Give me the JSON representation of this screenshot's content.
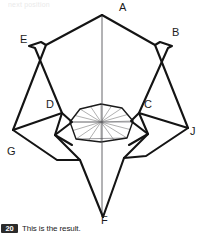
{
  "page": {
    "background_color": "#ffffff",
    "faded_header_text": "next position",
    "ink_color": "#1a1a1a",
    "crease_color": "#6d6d6d"
  },
  "caption": {
    "step_number": "20",
    "text": "This is the result."
  },
  "figure": {
    "name": "origami-folded-model",
    "vertex_labels": [
      {
        "id": "A",
        "label": "A",
        "x": 119,
        "y": 11
      },
      {
        "id": "B",
        "label": "B",
        "x": 172,
        "y": 36
      },
      {
        "id": "C",
        "label": "C",
        "x": 144,
        "y": 108
      },
      {
        "id": "D",
        "label": "D",
        "x": 46,
        "y": 108
      },
      {
        "id": "E",
        "label": "E",
        "x": 20,
        "y": 43
      },
      {
        "id": "F",
        "label": "F",
        "x": 101,
        "y": 224
      },
      {
        "id": "G",
        "label": "G",
        "x": 7,
        "y": 155
      },
      {
        "id": "J",
        "label": "J",
        "x": 190,
        "y": 135
      }
    ],
    "outline_points": [
      [
        102,
        15
      ],
      [
        168,
        48
      ],
      [
        172,
        46
      ],
      [
        160,
        42
      ],
      [
        155,
        45
      ],
      [
        188,
        128
      ],
      [
        170,
        122
      ],
      [
        139,
        113
      ],
      [
        131,
        121
      ],
      [
        148,
        134
      ],
      [
        124,
        158
      ],
      [
        103,
        217
      ],
      [
        80,
        160
      ],
      [
        55,
        135
      ],
      [
        72,
        122
      ],
      [
        62,
        113
      ],
      [
        31,
        122
      ],
      [
        13,
        130
      ],
      [
        46,
        45
      ],
      [
        41,
        42
      ],
      [
        29,
        46
      ],
      [
        35,
        48
      ]
    ],
    "main_strokes": [
      {
        "name": "apex-left-edge",
        "points": [
          [
            102,
            15
          ],
          [
            46,
            45
          ],
          [
            13,
            130
          ]
        ]
      },
      {
        "name": "apex-right-edge",
        "points": [
          [
            102,
            15
          ],
          [
            155,
            45
          ],
          [
            188,
            128
          ]
        ]
      },
      {
        "name": "left-peak",
        "points": [
          [
            46,
            45
          ],
          [
            41,
            42
          ],
          [
            29,
            46
          ],
          [
            35,
            48
          ],
          [
            62,
            113
          ]
        ]
      },
      {
        "name": "right-peak",
        "points": [
          [
            155,
            45
          ],
          [
            160,
            42
          ],
          [
            172,
            46
          ],
          [
            168,
            48
          ],
          [
            139,
            113
          ]
        ]
      },
      {
        "name": "left-lower-flap",
        "points": [
          [
            13,
            130
          ],
          [
            62,
            113
          ],
          [
            72,
            122
          ],
          [
            55,
            135
          ],
          [
            80,
            160
          ],
          [
            103,
            217
          ]
        ]
      },
      {
        "name": "right-lower-flap",
        "points": [
          [
            188,
            128
          ],
          [
            139,
            113
          ],
          [
            131,
            121
          ],
          [
            148,
            134
          ],
          [
            124,
            158
          ],
          [
            103,
            217
          ]
        ]
      },
      {
        "name": "left-flap-fold",
        "points": [
          [
            13,
            130
          ],
          [
            57,
            160
          ],
          [
            80,
            160
          ]
        ]
      },
      {
        "name": "right-flap-fold",
        "points": [
          [
            188,
            128
          ],
          [
            146,
            156
          ],
          [
            124,
            158
          ]
        ]
      },
      {
        "name": "left-inner-tab",
        "points": [
          [
            62,
            113
          ],
          [
            55,
            135
          ],
          [
            72,
            145
          ]
        ]
      },
      {
        "name": "right-inner-tab",
        "points": [
          [
            139,
            113
          ],
          [
            148,
            134
          ],
          [
            129,
            145
          ]
        ]
      }
    ],
    "axis_line": {
      "name": "vertical-centre-crease",
      "points": [
        [
          102,
          15
        ],
        [
          102,
          217
        ]
      ]
    },
    "rosette": {
      "name": "central-pleated-rosette",
      "center": [
        101,
        122
      ],
      "outline": [
        [
          101,
          104
        ],
        [
          122,
          108
        ],
        [
          133,
          121
        ],
        [
          127,
          138
        ],
        [
          101,
          142
        ],
        [
          76,
          139
        ],
        [
          70,
          122
        ],
        [
          80,
          109
        ]
      ],
      "spoke_count": 8,
      "has_radial_creases": true,
      "has_horizontal_crease": true
    }
  }
}
